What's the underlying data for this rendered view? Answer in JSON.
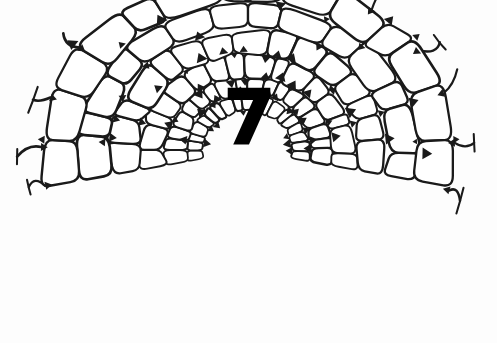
{
  "figure": {
    "kind": "botanical-line-drawing",
    "center_label": "7",
    "background_color": "#fdfdfd",
    "ink_color": "#1a1a1a",
    "cell_fill_color": "#ffffff",
    "label_color": "#000000",
    "canvas": {
      "width": 497,
      "height": 343
    }
  },
  "diagram": {
    "center_x": 248,
    "center_y": 150,
    "start_angle_deg": 168,
    "end_angle_deg": 372,
    "rings": [
      {
        "name": "ring-1-innermost",
        "radius_inner": 44,
        "radius_outer": 62,
        "cell_count": 19,
        "stroke_width": 2.0,
        "radius_jitter": 2.2,
        "angle_jitter": 0.22,
        "corner_round": 0.3,
        "squash_y": 0.88
      },
      {
        "name": "ring-2",
        "radius_inner": 62,
        "radius_outer": 84,
        "cell_count": 18,
        "stroke_width": 2.1,
        "radius_jitter": 2.8,
        "angle_jitter": 0.24,
        "corner_round": 0.3,
        "squash_y": 0.88
      },
      {
        "name": "ring-3",
        "radius_inner": 84,
        "radius_outer": 110,
        "cell_count": 16,
        "stroke_width": 2.2,
        "radius_jitter": 3.4,
        "angle_jitter": 0.26,
        "corner_round": 0.28,
        "squash_y": 0.87
      },
      {
        "name": "ring-4",
        "radius_inner": 110,
        "radius_outer": 141,
        "cell_count": 15,
        "stroke_width": 2.3,
        "radius_jitter": 4.0,
        "angle_jitter": 0.28,
        "corner_round": 0.26,
        "squash_y": 0.86
      },
      {
        "name": "ring-5",
        "radius_inner": 141,
        "radius_outer": 173,
        "cell_count": 14,
        "stroke_width": 2.4,
        "radius_jitter": 4.4,
        "angle_jitter": 0.28,
        "corner_round": 0.26,
        "squash_y": 0.86
      },
      {
        "name": "ring-6-outermost",
        "radius_inner": 173,
        "radius_outer": 208,
        "cell_count": 13,
        "stroke_width": 2.5,
        "radius_jitter": 5.0,
        "angle_jitter": 0.3,
        "corner_round": 0.24,
        "squash_y": 0.85
      }
    ],
    "wall_stubs": {
      "count": 13,
      "length": 20,
      "stroke_width": 2.4,
      "description": "broken cell-wall projections at the cut margin"
    },
    "junction_thickenings": {
      "size": 5.0,
      "description": "dark triangular intercellular thickenings at three-way wall junctions"
    }
  }
}
